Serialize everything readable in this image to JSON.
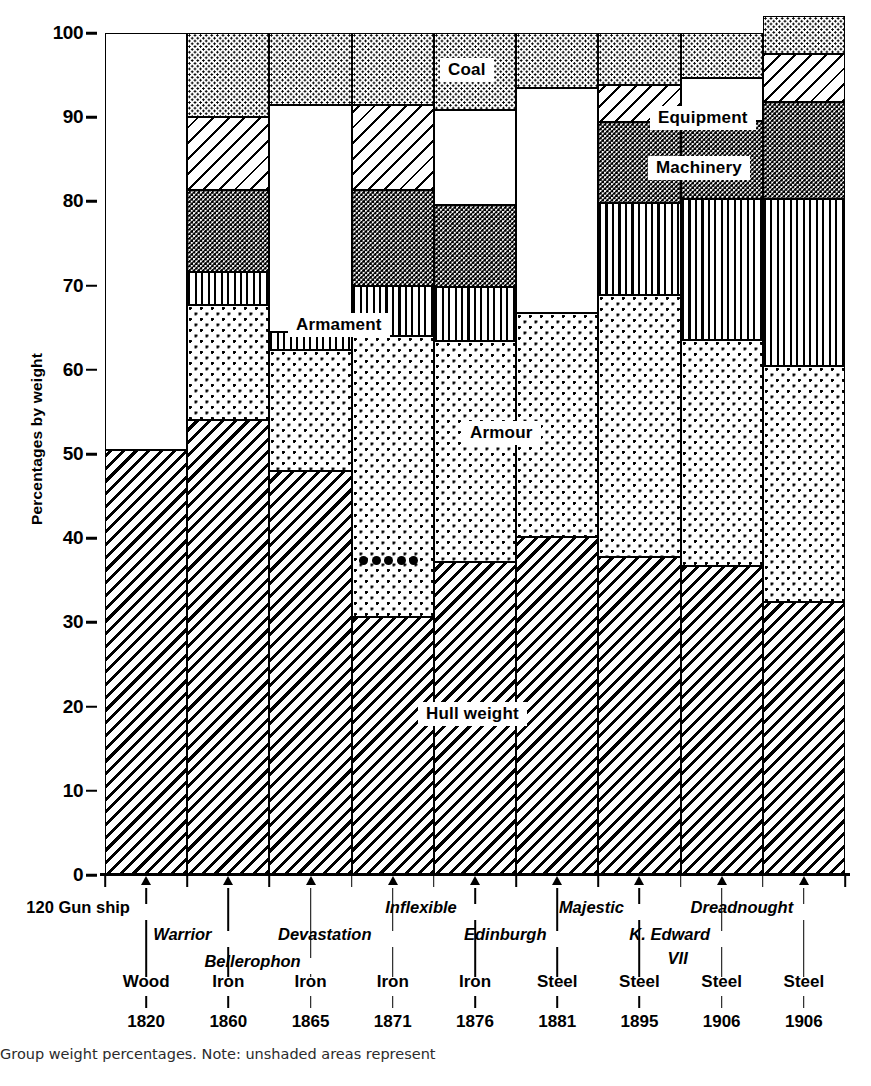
{
  "chart_data": {
    "type": "bar",
    "title": "",
    "xlabel": "",
    "ylabel": "Percentages by weight",
    "ylim": [
      0,
      100
    ],
    "yticks": [
      0,
      10,
      20,
      30,
      40,
      50,
      60,
      70,
      80,
      90,
      100
    ],
    "grid": false,
    "stacked": true,
    "legend_position": "in-plot callouts",
    "note": "Unshaded (white) areas represent data not available / not separately itemised.",
    "categories": [
      "120 Gun ship",
      "Warrior",
      "Bellerophon",
      "Devastation",
      "Inflexible",
      "Edinburgh",
      "Majestic",
      "K. Edward VII",
      "Dreadnought"
    ],
    "category_material": [
      "Wood",
      "Iron",
      "Iron",
      "Iron",
      "Iron",
      "Steel",
      "Steel",
      "Steel",
      "Steel"
    ],
    "category_year": [
      "1820",
      "1860",
      "1865",
      "1871",
      "1876",
      "1881",
      "1895",
      "1906",
      "1906"
    ],
    "series": [
      {
        "name": "Hull weight",
        "values": [
          50.5,
          54.0,
          48.0,
          30.7,
          37.2,
          40.2,
          37.8,
          36.7,
          32.4
        ]
      },
      {
        "name": "Armour",
        "values": [
          0.0,
          13.7,
          14.3,
          33.3,
          26.2,
          26.6,
          31.1,
          26.8,
          28.0
        ]
      },
      {
        "name": "Armament",
        "values": [
          0.0,
          3.9,
          2.2,
          6.0,
          6.4,
          0.0,
          10.9,
          16.8,
          19.9
        ]
      },
      {
        "name": "Machinery",
        "values": [
          0.0,
          9.7,
          0.0,
          11.4,
          9.8,
          0.0,
          9.6,
          9.2,
          11.5
        ]
      },
      {
        "name": "Equipment",
        "values": [
          0.0,
          8.7,
          0.0,
          10.0,
          0.0,
          0.0,
          4.4,
          0.0,
          5.7
        ]
      },
      {
        "name": "Coal",
        "values": [
          0.0,
          10.0,
          8.5,
          8.6,
          9.1,
          6.5,
          6.2,
          5.4,
          4.5
        ]
      },
      {
        "name": "Unshaded",
        "values": [
          49.5,
          0.0,
          27.0,
          0.0,
          11.3,
          26.7,
          0.0,
          5.1,
          0.0
        ]
      }
    ]
  },
  "axis": {
    "y_label": "Percentages by weight",
    "y_ticks": [
      "100",
      "90",
      "80",
      "70",
      "60",
      "50",
      "40",
      "30",
      "20",
      "10",
      "0"
    ]
  },
  "segment_labels": {
    "coal": "Coal",
    "equipment": "Equipment",
    "machinery": "Machinery",
    "armament": "Armament",
    "armour": "Armour",
    "hull": "Hull weight"
  },
  "ships": [
    {
      "name": "120 Gun ship",
      "italic": false,
      "material": "Wood",
      "year": "1820"
    },
    {
      "name": "Warrior",
      "italic": true,
      "material": "Iron",
      "year": "1860"
    },
    {
      "name": "Bellerophon",
      "italic": true,
      "material": "Iron",
      "year": "1865"
    },
    {
      "name": "Devastation",
      "italic": true,
      "material": "Iron",
      "year": "1871"
    },
    {
      "name": "Inflexible",
      "italic": true,
      "material": "Iron",
      "year": "1876"
    },
    {
      "name": "Edinburgh",
      "italic": true,
      "material": "Steel",
      "year": "1881"
    },
    {
      "name": "Majestic",
      "italic": true,
      "material": "Steel",
      "year": "1895"
    },
    {
      "name": "K. Edward",
      "name2": "VII",
      "italic": true,
      "material": "Steel",
      "year": "1906"
    },
    {
      "name": "Dreadnought",
      "italic": true,
      "material": "Steel",
      "year": "1906"
    }
  ],
  "caption": "Group weight percentages. Note: unshaded areas represent",
  "colors": {
    "ink": "#000000",
    "paper": "#ffffff",
    "caption_text": "#2b2b2b"
  }
}
